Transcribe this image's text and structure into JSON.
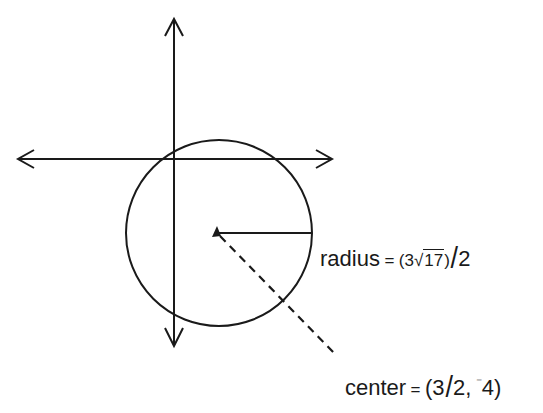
{
  "diagram": {
    "type": "circle-on-coordinate-axes",
    "colors": {
      "stroke": "#1a1a1a",
      "background": "#ffffff"
    },
    "axes": {
      "horizontal": {
        "arrows": "both"
      },
      "vertical": {
        "arrows": "both"
      }
    },
    "circle": {
      "center_label": {
        "name": "center",
        "equals": "=",
        "open": "(",
        "x_num": "3",
        "x_den": "2",
        "comma": ",",
        "neg": "⁻",
        "y": "4",
        "close": ")"
      },
      "radius_label": {
        "name": "radius",
        "equals": "=",
        "open": "(",
        "coef": "3",
        "radical": "√",
        "radicand": "17",
        "close": ")",
        "den": "2"
      }
    }
  }
}
